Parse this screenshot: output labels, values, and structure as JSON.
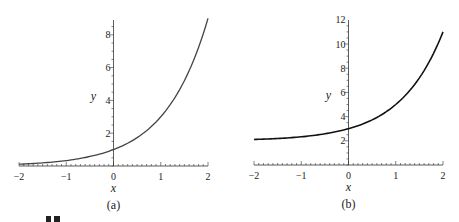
{
  "chart_data": [
    {
      "type": "line",
      "panel_label": "(a)",
      "xlabel": "x",
      "ylabel": "y",
      "xlim": [
        -2,
        2
      ],
      "ylim": [
        0,
        9
      ],
      "x_ticks": [
        -2,
        -1,
        0,
        1,
        2
      ],
      "x_tick_labels": [
        "−2",
        "−1",
        "0",
        "1",
        "2"
      ],
      "y_ticks": [
        2,
        4,
        6,
        8
      ],
      "y_tick_labels": [
        "2",
        "4",
        "6",
        "8"
      ],
      "series": [
        {
          "name": "curve",
          "function": "3^x",
          "x": [
            -2,
            -1.5,
            -1,
            -0.5,
            0,
            0.5,
            1,
            1.5,
            2
          ],
          "y": [
            0.11,
            0.19,
            0.33,
            0.58,
            1,
            1.73,
            3,
            5.2,
            9
          ]
        }
      ],
      "grid": false,
      "color": "#444444"
    },
    {
      "type": "line",
      "panel_label": "(b)",
      "xlabel": "x",
      "ylabel": "y",
      "xlim": [
        -2,
        2
      ],
      "ylim": [
        0,
        12
      ],
      "x_ticks": [
        -2,
        -1,
        0,
        1,
        2
      ],
      "x_tick_labels": [
        "−2",
        "−1",
        "0",
        "1",
        "2"
      ],
      "y_ticks": [
        2,
        4,
        6,
        8,
        10,
        12
      ],
      "y_tick_labels": [
        "2",
        "4",
        "6",
        "8",
        "10",
        "12"
      ],
      "series": [
        {
          "name": "curve",
          "function": "2 + 3^x",
          "x": [
            -2,
            -1.5,
            -1,
            -0.5,
            0,
            0.5,
            1,
            1.5,
            2
          ],
          "y": [
            2.11,
            2.19,
            2.33,
            2.58,
            3,
            3.73,
            5,
            7.2,
            11
          ]
        }
      ],
      "grid": false,
      "color": "#111111"
    }
  ]
}
